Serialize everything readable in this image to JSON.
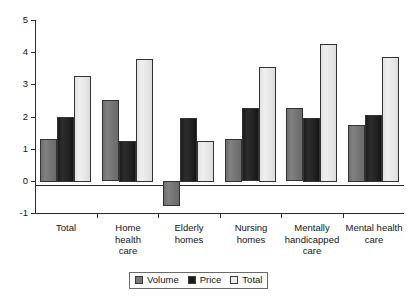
{
  "chart_data": {
    "type": "bar",
    "title": "",
    "subtitle": "",
    "xlabel": "",
    "ylabel": "",
    "ylim": [
      -1,
      5
    ],
    "yticks": [
      -1,
      0,
      1,
      2,
      3,
      4,
      5
    ],
    "ytick_labels": [
      "-1",
      "0",
      "1",
      "2",
      "3",
      "4",
      "5"
    ],
    "grid": false,
    "legend_position": "bottom-center",
    "zero_line": true,
    "categories": [
      "Total",
      "Home health care",
      "Elderly homes",
      "Nursing homes",
      "Mentally handicapped care",
      "Mental health care"
    ],
    "category_lines": [
      [
        "Total"
      ],
      [
        "Home",
        "health",
        "care"
      ],
      [
        "Elderly",
        "homes"
      ],
      [
        "Nursing",
        "homes"
      ],
      [
        "Mentally",
        "handicapped",
        "care"
      ],
      [
        "Mental health",
        "care"
      ]
    ],
    "series": [
      {
        "name": "Volume",
        "color": "#787878",
        "values": [
          1.3,
          2.5,
          -0.75,
          1.3,
          2.25,
          1.75
        ]
      },
      {
        "name": "Price",
        "color": "#1d1d1d",
        "values": [
          2.0,
          1.25,
          1.95,
          2.25,
          1.95,
          2.05
        ]
      },
      {
        "name": "Total",
        "color": "#ededed",
        "values": [
          3.25,
          3.8,
          1.25,
          3.55,
          4.25,
          3.85
        ]
      }
    ]
  },
  "legend": {
    "items": [
      {
        "label": "Volume",
        "key": "volume"
      },
      {
        "label": "Price",
        "key": "price"
      },
      {
        "label": "Total",
        "key": "total"
      }
    ]
  }
}
